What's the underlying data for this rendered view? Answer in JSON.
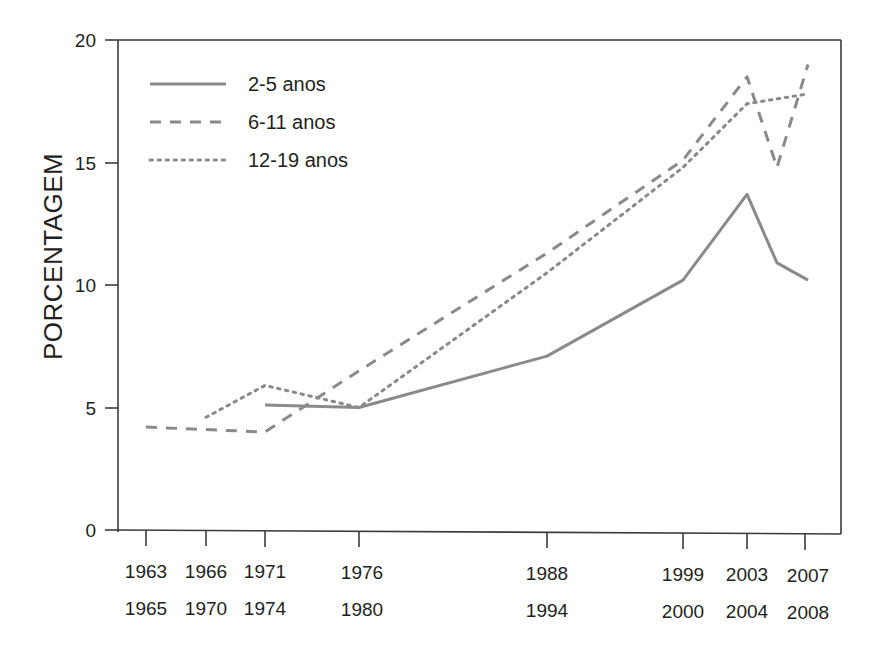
{
  "chart_data": {
    "type": "line",
    "title": "",
    "xlabel": "",
    "ylabel": "PORCENTAGEM",
    "ylim": [
      0,
      20
    ],
    "yticks": [
      0,
      5,
      10,
      15,
      20
    ],
    "ytick_labels": [
      "0",
      "5",
      "10",
      "15",
      "20"
    ],
    "grid": false,
    "legend_position": "top-left",
    "categories": [
      "1963\n1965",
      "1966\n1970",
      "1971\n1974",
      "1976\n1980",
      "1988\n1994",
      "1999\n2000",
      "2003\n2004",
      "2007\n2008"
    ],
    "xtick_labels_top": [
      "1963",
      "1966",
      "1971",
      "1976",
      "1988",
      "1999",
      "2003",
      "2007"
    ],
    "xtick_labels_bottom": [
      "1965",
      "1970",
      "1974",
      "1980",
      "1994",
      "2000",
      "2004",
      "2008"
    ],
    "series": [
      {
        "name": "2-5 anos",
        "style": "solid",
        "color": "#8a8a8a",
        "x": [
          "1971\n1974",
          "1976\n1980",
          "1988\n1994",
          "1999\n2000",
          "2003\n2004",
          "2005\n2006",
          "2007\n2008"
        ],
        "values": [
          5.1,
          5.0,
          7.1,
          10.2,
          13.7,
          10.9,
          10.2
        ]
      },
      {
        "name": "6-11 anos",
        "style": "dashed",
        "color": "#8a8a8a",
        "x": [
          "1963\n1965",
          "1971\n1974",
          "1976\n1980",
          "1988\n1994",
          "1999\n2000",
          "2003\n2004",
          "2005\n2006",
          "2007\n2008"
        ],
        "values": [
          4.2,
          4.0,
          6.5,
          11.3,
          15.1,
          18.5,
          14.8,
          19.0
        ]
      },
      {
        "name": "12-19 anos",
        "style": "dotted",
        "color": "#8a8a8a",
        "x": [
          "1966\n1970",
          "1971\n1974",
          "1976\n1980",
          "1988\n1994",
          "1999\n2000",
          "2003\n2004",
          "2007\n2008"
        ],
        "values": [
          4.6,
          5.9,
          5.0,
          10.5,
          14.8,
          17.4,
          17.8
        ]
      }
    ],
    "legend": [
      {
        "label": "2-5 anos",
        "style": "solid"
      },
      {
        "label": "6-11 anos",
        "style": "dashed"
      },
      {
        "label": "12-19 anos",
        "style": "dotted"
      }
    ]
  }
}
